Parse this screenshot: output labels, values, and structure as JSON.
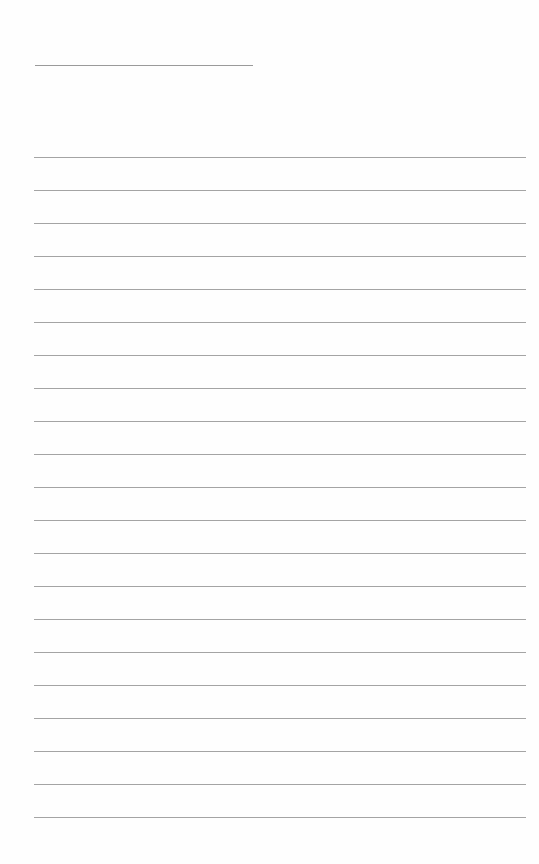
{
  "page": {
    "type": "lined-paper",
    "background_color": "#fefefe",
    "line_color": "#a4a4a4",
    "title_line": {
      "x": 35,
      "y": 65,
      "width": 218
    },
    "rules": {
      "count": 21,
      "first_y": 157,
      "spacing": 33,
      "x": 34,
      "width": 492
    }
  }
}
